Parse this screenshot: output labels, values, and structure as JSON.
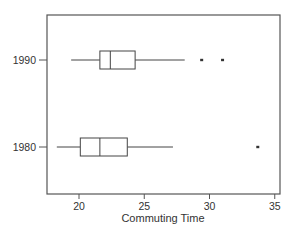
{
  "chart_data": {
    "type": "boxplot",
    "orientation": "horizontal",
    "title": "",
    "xlabel": "Commuting Time",
    "ylabel": "",
    "xlim": [
      17.5,
      35.4
    ],
    "xticks": [
      20,
      25,
      30,
      35
    ],
    "xtick_labels": [
      "20",
      "25",
      "30",
      "35"
    ],
    "categories": [
      "1980",
      "1990"
    ],
    "grid": false,
    "legend": null,
    "series": [
      {
        "name": "1980",
        "whisker_low": 18.3,
        "q1": 20.1,
        "median": 21.6,
        "q3": 23.7,
        "whisker_high": 27.2,
        "outliers": [
          33.7
        ]
      },
      {
        "name": "1990",
        "whisker_low": 19.4,
        "q1": 21.6,
        "median": 22.4,
        "q3": 24.3,
        "whisker_high": 28.1,
        "outliers": [
          29.4,
          31.0
        ]
      }
    ]
  },
  "axes": {
    "x_title": "Commuting Time",
    "y_labels": [
      "1990",
      "1980"
    ]
  },
  "colors": {
    "frame": "#555555",
    "box_stroke": "#444444",
    "text": "#333333",
    "background": "#ffffff"
  }
}
